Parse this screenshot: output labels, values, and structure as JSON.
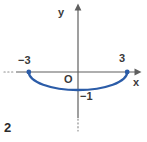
{
  "figure_number": "2",
  "axis_labels": {
    "x": "x",
    "y": "y"
  },
  "origin_label": "O",
  "tick_labels": {
    "left_x": "−3",
    "right_x": "3",
    "bottom_y": "−1"
  },
  "colors": {
    "curve": "#2b5ca8",
    "axis": "#5f5f5f",
    "dotted": "#8f8f8f",
    "text": "#3a3a3a",
    "background": "#ffffff"
  },
  "chart_data": {
    "type": "line",
    "title": "",
    "x": [
      -3,
      0,
      3
    ],
    "y": [
      0,
      -1,
      0
    ],
    "xlabel": "x",
    "ylabel": "y",
    "xlim": [
      -4.5,
      4.2
    ],
    "ylim": [
      -3.9,
      3.8
    ],
    "grid": false,
    "legend": false,
    "curve": {
      "kind": "elliptical-arc-lower-half",
      "rx": 3,
      "ry": 1,
      "endpoints_marked": true
    },
    "axis_style": {
      "x_arrow": "right",
      "y_arrow": "up",
      "x_dotted_extension": "left",
      "y_dotted_extension": "down"
    }
  }
}
